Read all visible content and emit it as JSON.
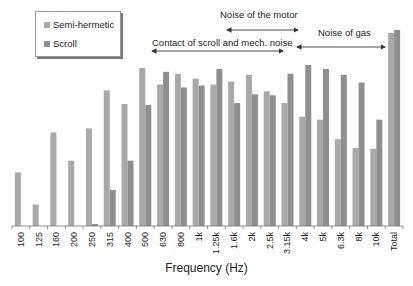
{
  "chart_data": {
    "type": "bar",
    "title": "",
    "xlabel": "Frequency (Hz)",
    "ylabel": "",
    "categories": [
      "100",
      "125",
      "160",
      "200",
      "250",
      "315",
      "400",
      "500",
      "630",
      "800",
      "1k",
      "1.25k",
      "1.6k",
      "2k",
      "2.5k",
      "3.15k",
      "4k",
      "5k",
      "6.3k",
      "8k",
      "10k",
      "Total"
    ],
    "series": [
      {
        "name": "Semi-hermetic",
        "color": "#a9a9a9",
        "values": [
          55,
          22,
          96,
          67,
          100,
          139,
          125,
          162,
          145,
          156,
          151,
          145,
          148,
          155,
          138,
          126,
          112,
          109,
          89,
          80,
          79,
          198
        ]
      },
      {
        "name": "Scroll",
        "color": "#8f8f8f",
        "values": [
          0,
          0,
          0,
          0,
          2,
          37,
          67,
          124,
          158,
          142,
          144,
          161,
          126,
          135,
          134,
          156,
          165,
          161,
          155,
          147,
          109,
          201
        ]
      }
    ],
    "ylim": [
      0,
      205
    ],
    "grid": false,
    "y_axis_visible": false,
    "legend_position": "top-left",
    "annotations": [
      {
        "text": "Noise of the motor",
        "range": [
          "1.25k",
          "3.15k"
        ]
      },
      {
        "text": "Contact of scroll and mech. noise",
        "range": [
          "500",
          "3.15k"
        ]
      },
      {
        "text": "Noise of gas",
        "range": [
          "4k",
          "10k"
        ]
      }
    ]
  },
  "legend": {
    "items": [
      {
        "label": "Semi-hermetic",
        "color": "#a9a9a9"
      },
      {
        "label": "Scroll",
        "color": "#8f8f8f"
      }
    ]
  },
  "annotations": {
    "motor": "Noise of the motor",
    "contact": "Contact of scroll and mech. noise",
    "gas": "Noise of gas"
  },
  "axis": {
    "xlabel": "Frequency (Hz)"
  }
}
